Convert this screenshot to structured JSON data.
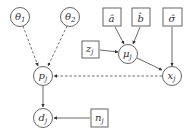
{
  "diagram": {
    "type": "graphical-model",
    "colors": {
      "stroke": "#555555",
      "text": "#333333",
      "background": "#ffffff"
    },
    "nodes": [
      {
        "id": "theta1",
        "shape": "circle",
        "label": "θ",
        "sub": "1",
        "cx": 20,
        "cy": 17
      },
      {
        "id": "theta2",
        "shape": "circle",
        "label": "θ",
        "sub": "2",
        "cx": 70,
        "cy": 17
      },
      {
        "id": "a_hat",
        "shape": "box",
        "label": "â",
        "x": 103,
        "y": 8
      },
      {
        "id": "b_hat",
        "shape": "box",
        "label": "b̂",
        "x": 132,
        "y": 8
      },
      {
        "id": "sigma_hat",
        "shape": "box",
        "label": "σ̂",
        "x": 163,
        "y": 8
      },
      {
        "id": "z_j",
        "shape": "box",
        "label": "z",
        "sub": "j",
        "x": 82,
        "y": 41
      },
      {
        "id": "mu_j",
        "shape": "circle",
        "label": "μ",
        "sub": "j",
        "cx": 128,
        "cy": 54
      },
      {
        "id": "x_j",
        "shape": "circle",
        "label": "x",
        "sub": "j",
        "cx": 172,
        "cy": 76
      },
      {
        "id": "p_j",
        "shape": "circle",
        "label": "p",
        "sub": "j",
        "cx": 43,
        "cy": 76
      },
      {
        "id": "d_j",
        "shape": "circle",
        "label": "d",
        "sub": "j",
        "cx": 43,
        "cy": 118
      },
      {
        "id": "n_j",
        "shape": "box",
        "label": "n",
        "sub": "j",
        "x": 91,
        "y": 109
      }
    ],
    "edges": [
      {
        "from": "theta1",
        "to": "p_j",
        "style": "dashed"
      },
      {
        "from": "theta2",
        "to": "p_j",
        "style": "dashed"
      },
      {
        "from": "a_hat",
        "to": "mu_j",
        "style": "solid"
      },
      {
        "from": "b_hat",
        "to": "mu_j",
        "style": "solid"
      },
      {
        "from": "z_j",
        "to": "mu_j",
        "style": "solid"
      },
      {
        "from": "mu_j",
        "to": "x_j",
        "style": "solid"
      },
      {
        "from": "sigma_hat",
        "to": "x_j",
        "style": "solid"
      },
      {
        "from": "x_j",
        "to": "p_j",
        "style": "dashed"
      },
      {
        "from": "p_j",
        "to": "d_j",
        "style": "solid"
      },
      {
        "from": "n_j",
        "to": "d_j",
        "style": "solid"
      }
    ]
  },
  "labels": {
    "theta1": "θ",
    "theta1_sub": "1",
    "theta2": "θ",
    "theta2_sub": "2",
    "a_hat": "â",
    "b_hat": "b̂",
    "sigma_hat": "σ̂",
    "z": "z",
    "z_sub": "j",
    "mu": "μ",
    "mu_sub": "j",
    "x": "x",
    "x_sub": "j",
    "p": "p",
    "p_sub": "j",
    "d": "d",
    "d_sub": "j",
    "n": "n",
    "n_sub": "j"
  }
}
